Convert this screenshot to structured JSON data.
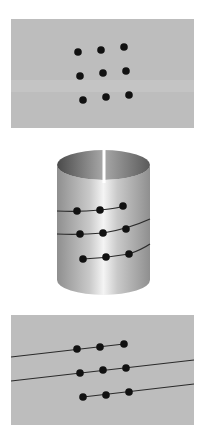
{
  "figure": {
    "width": 207,
    "height": 448,
    "background": "#ffffff",
    "panel_color": "#bdbdbd",
    "dot_color": "#111111",
    "line_color": "#2a2a2a",
    "dot_radius": 3.8
  },
  "panels": [
    {
      "id": "flat-sheet-dots",
      "x": 11,
      "y": 19,
      "w": 183,
      "h": 109,
      "band": {
        "y": 80,
        "h": 12,
        "color": "#c8c8c8"
      },
      "dots": [
        [
          78,
          52
        ],
        [
          101,
          50
        ],
        [
          124,
          47
        ],
        [
          80,
          76
        ],
        [
          103,
          73
        ],
        [
          126,
          71
        ],
        [
          83,
          100
        ],
        [
          106,
          97
        ],
        [
          129,
          95
        ]
      ],
      "lines": []
    },
    {
      "id": "unrolled-sheet-helix",
      "x": 11,
      "y": 315,
      "w": 183,
      "h": 110,
      "dots": [
        [
          77,
          349
        ],
        [
          100,
          347
        ],
        [
          124,
          344
        ],
        [
          80,
          373
        ],
        [
          103,
          370
        ],
        [
          126,
          368
        ],
        [
          83,
          397
        ],
        [
          106,
          395
        ],
        [
          129,
          392
        ]
      ],
      "lines": [
        [
          [
            11,
            357
          ],
          [
            124,
            344
          ]
        ],
        [
          [
            11,
            381
          ],
          [
            194,
            360
          ]
        ],
        [
          [
            83,
            397
          ],
          [
            194,
            384
          ]
        ]
      ]
    }
  ],
  "cylinder": {
    "cx": 103.5,
    "left": 57,
    "right": 150,
    "top_y": 165,
    "bottom_y": 280,
    "ry": 15,
    "edge_color": "#8f8f8f",
    "highlight_color": "#f4f4f4",
    "interior_dark": "#4a4a4a",
    "interior_light": "#a8a8a8",
    "slit": {
      "x": 104,
      "y1": 150,
      "y2": 183,
      "w": 3,
      "color": "#ffffff"
    },
    "dots": [
      [
        77,
        211
      ],
      [
        100,
        210
      ],
      [
        123,
        206
      ],
      [
        80,
        234
      ],
      [
        103,
        233
      ],
      [
        126,
        229
      ],
      [
        83,
        259
      ],
      [
        106,
        257
      ],
      [
        129,
        254
      ]
    ],
    "curves": [
      "M57,211 Q80,212 100,210 T123,206",
      "M57,234 Q80,235 103,233 Q128,229 150,219",
      "M83,259 Q106,258 129,254 Q141,250 150,244"
    ]
  }
}
